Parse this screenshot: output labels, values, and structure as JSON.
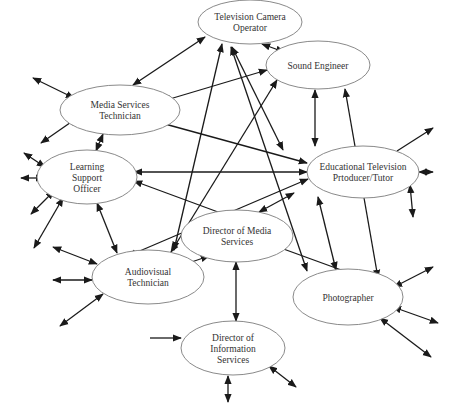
{
  "diagram": {
    "type": "network",
    "colors": {
      "edge": "#1a1a1a",
      "node_stroke": "#8a8a8a",
      "node_fill": "#ffffff",
      "text": "#333333"
    },
    "nodes": [
      {
        "id": "tv_camera",
        "lines": [
          "Television Camera",
          "Operator"
        ],
        "cx": 250,
        "cy": 22,
        "rx": 52,
        "ry": 22
      },
      {
        "id": "media_tech",
        "lines": [
          "Media Services",
          "Technician"
        ],
        "cx": 120,
        "cy": 110,
        "rx": 60,
        "ry": 25
      },
      {
        "id": "sound_eng",
        "lines": [
          "Sound Engineer"
        ],
        "cx": 318,
        "cy": 65,
        "rx": 52,
        "ry": 24
      },
      {
        "id": "learning",
        "lines": [
          "Learning",
          "Support",
          "Officer"
        ],
        "cx": 87,
        "cy": 177,
        "rx": 50,
        "ry": 27
      },
      {
        "id": "edu_tv",
        "lines": [
          "Educational Television",
          "Prtoducer/Tutor"
        ],
        "cx": 363,
        "cy": 172,
        "rx": 56,
        "ry": 26
      },
      {
        "id": "dir_media",
        "lines": [
          "Director of Media",
          "Services"
        ],
        "cx": 237,
        "cy": 236,
        "rx": 56,
        "ry": 26
      },
      {
        "id": "av_tech",
        "lines": [
          "Audiovisual",
          "Technician"
        ],
        "cx": 148,
        "cy": 277,
        "rx": 56,
        "ry": 27
      },
      {
        "id": "photographer",
        "lines": [
          "Photographer"
        ],
        "cx": 348,
        "cy": 297,
        "rx": 55,
        "ry": 28
      },
      {
        "id": "dir_info",
        "lines": [
          "Director of",
          "Information",
          "Services"
        ],
        "cx": 233,
        "cy": 348,
        "rx": 52,
        "ry": 27
      }
    ],
    "edges": [
      {
        "from": "tv_camera",
        "to": "media_tech",
        "x1": 205,
        "y1": 37,
        "x2": 133,
        "y2": 85,
        "start_arrow": true,
        "end_arrow": true
      },
      {
        "from": "tv_camera",
        "to": "sound_eng",
        "x1": 262,
        "y1": 44,
        "x2": 284,
        "y2": 52,
        "start_arrow": true,
        "end_arrow": true
      },
      {
        "from": "tv_camera",
        "to": "av_tech",
        "x1": 222,
        "y1": 44,
        "x2": 174,
        "y2": 250,
        "start_arrow": true,
        "end_arrow": true
      },
      {
        "from": "tv_camera",
        "to": "edu_tv",
        "x1": 232,
        "y1": 47,
        "x2": 283,
        "y2": 150,
        "start_arrow": true,
        "end_arrow": true
      },
      {
        "from": "tv_camera",
        "to": "photographer",
        "x1": 231,
        "y1": 47,
        "x2": 307,
        "y2": 271,
        "start_arrow": true,
        "end_arrow": true
      },
      {
        "from": "sound_eng",
        "to": "media_tech",
        "x1": 267,
        "y1": 70,
        "x2": 163,
        "y2": 101,
        "start_arrow": true,
        "end_arrow": true
      },
      {
        "from": "sound_eng",
        "to": "edu_tv",
        "x1": 315,
        "y1": 90,
        "x2": 315,
        "y2": 146,
        "start_arrow": true,
        "end_arrow": true
      },
      {
        "from": "sound_eng",
        "to": "av_tech",
        "x1": 277,
        "y1": 80,
        "x2": 171,
        "y2": 252,
        "start_arrow": true,
        "end_arrow": true
      },
      {
        "from": "sound_eng",
        "to": "photographer",
        "x1": 345,
        "y1": 89,
        "x2": 378,
        "y2": 278,
        "start_arrow": true,
        "end_arrow": true
      },
      {
        "from": "media_tech",
        "to": "edu_tv",
        "x1": 154,
        "y1": 121,
        "x2": 307,
        "y2": 163,
        "start_arrow": true,
        "end_arrow": true
      },
      {
        "from": "media_tech",
        "to": "learning",
        "x1": 103,
        "y1": 134,
        "x2": 96,
        "y2": 151,
        "start_arrow": true,
        "end_arrow": true
      },
      {
        "from": "learning",
        "to": "edu_tv",
        "x1": 134,
        "y1": 172,
        "x2": 307,
        "y2": 172,
        "start_arrow": true,
        "end_arrow": true
      },
      {
        "from": "learning",
        "to": "av_tech",
        "x1": 97,
        "y1": 203,
        "x2": 117,
        "y2": 253,
        "start_arrow": true,
        "end_arrow": true
      },
      {
        "from": "dir_media",
        "to": "learning",
        "x1": 218,
        "y1": 212,
        "x2": 134,
        "y2": 181,
        "start_arrow": false,
        "end_arrow": true
      },
      {
        "from": "edu_tv",
        "to": "av_tech",
        "x1": 308,
        "y1": 179,
        "x2": 128,
        "y2": 256,
        "start_arrow": true,
        "end_arrow": true
      },
      {
        "from": "edu_tv",
        "to": "dir_media",
        "x1": 294,
        "y1": 193,
        "x2": 259,
        "y2": 212,
        "start_arrow": true,
        "end_arrow": true
      },
      {
        "from": "edu_tv",
        "to": "photographer",
        "x1": 318,
        "y1": 197,
        "x2": 336,
        "y2": 270,
        "start_arrow": true,
        "end_arrow": true
      },
      {
        "from": "dir_media",
        "to": "av_tech",
        "x1": 209,
        "y1": 256,
        "x2": 177,
        "y2": 267,
        "start_arrow": true,
        "end_arrow": true
      },
      {
        "from": "dir_media",
        "to": "photographer",
        "x1": 278,
        "y1": 247,
        "x2": 355,
        "y2": 275,
        "start_arrow": false,
        "end_arrow": true
      },
      {
        "from": "dir_media",
        "to": "dir_info",
        "x1": 236,
        "y1": 262,
        "x2": 236,
        "y2": 321,
        "start_arrow": true,
        "end_arrow": true
      }
    ],
    "external_edges": [
      {
        "node": "media_tech",
        "x1": 33,
        "y1": 78,
        "x2": 74,
        "y2": 98,
        "start_arrow": true,
        "end_arrow": true
      },
      {
        "node": "media_tech",
        "x1": 41,
        "y1": 143,
        "x2": 77,
        "y2": 118,
        "start_arrow": true,
        "end_arrow": true
      },
      {
        "node": "learning",
        "x1": 24,
        "y1": 153,
        "x2": 45,
        "y2": 167,
        "start_arrow": true,
        "end_arrow": true
      },
      {
        "node": "learning",
        "x1": 21,
        "y1": 178,
        "x2": 44,
        "y2": 178,
        "start_arrow": true,
        "end_arrow": true
      },
      {
        "node": "learning",
        "x1": 31,
        "y1": 214,
        "x2": 54,
        "y2": 191,
        "start_arrow": true,
        "end_arrow": true
      },
      {
        "node": "learning",
        "x1": 34,
        "y1": 248,
        "x2": 63,
        "y2": 198,
        "start_arrow": true,
        "end_arrow": true
      },
      {
        "node": "av_tech",
        "x1": 53,
        "y1": 247,
        "x2": 97,
        "y2": 264,
        "start_arrow": true,
        "end_arrow": true
      },
      {
        "node": "av_tech",
        "x1": 53,
        "y1": 280,
        "x2": 92,
        "y2": 280,
        "start_arrow": true,
        "end_arrow": true
      },
      {
        "node": "av_tech",
        "x1": 60,
        "y1": 326,
        "x2": 103,
        "y2": 294,
        "start_arrow": true,
        "end_arrow": true
      },
      {
        "node": "edu_tv",
        "x1": 397,
        "y1": 151,
        "x2": 433,
        "y2": 128,
        "start_arrow": false,
        "end_arrow": true
      },
      {
        "node": "edu_tv",
        "x1": 419,
        "y1": 172,
        "x2": 433,
        "y2": 172,
        "start_arrow": true,
        "end_arrow": true
      },
      {
        "node": "edu_tv",
        "x1": 410,
        "y1": 185,
        "x2": 413,
        "y2": 217,
        "start_arrow": true,
        "end_arrow": true
      },
      {
        "node": "photographer",
        "x1": 394,
        "y1": 287,
        "x2": 433,
        "y2": 267,
        "start_arrow": true,
        "end_arrow": true
      },
      {
        "node": "photographer",
        "x1": 393,
        "y1": 307,
        "x2": 438,
        "y2": 323,
        "start_arrow": true,
        "end_arrow": true
      },
      {
        "node": "photographer",
        "x1": 380,
        "y1": 318,
        "x2": 431,
        "y2": 357,
        "start_arrow": true,
        "end_arrow": true
      },
      {
        "node": "dir_info",
        "x1": 150,
        "y1": 338,
        "x2": 181,
        "y2": 338,
        "start_arrow": false,
        "end_arrow": true
      },
      {
        "node": "dir_info",
        "x1": 228,
        "y1": 376,
        "x2": 228,
        "y2": 402,
        "start_arrow": true,
        "end_arrow": true
      },
      {
        "node": "dir_info",
        "x1": 269,
        "y1": 366,
        "x2": 296,
        "y2": 387,
        "start_arrow": true,
        "end_arrow": true
      }
    ]
  }
}
